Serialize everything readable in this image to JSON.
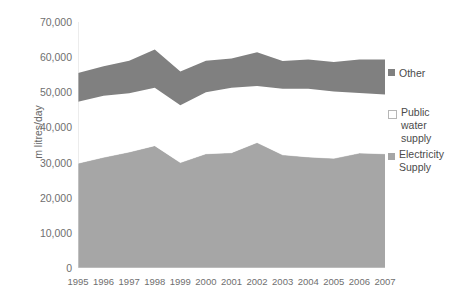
{
  "chart_data": {
    "type": "area",
    "stacked": true,
    "title": "",
    "subtitle": "",
    "xlabel": "",
    "ylabel": "m litres/day",
    "categories": [
      "1995",
      "1996",
      "1997",
      "1998",
      "1999",
      "2000",
      "2001",
      "2002",
      "2003",
      "2004",
      "2005",
      "2006",
      "2007"
    ],
    "ylim": [
      0,
      70000
    ],
    "ytick_labels": [
      "0",
      "10,000",
      "20,000",
      "30,000",
      "40,000",
      "50,000",
      "60,000",
      "70,000"
    ],
    "ytick_values": [
      0,
      10000,
      20000,
      30000,
      40000,
      50000,
      60000,
      70000
    ],
    "grid": false,
    "legend_position": "right",
    "series": [
      {
        "name": "Electricity Supply",
        "color": "#a6a6a6",
        "values": [
          29800,
          31500,
          33000,
          34800,
          30000,
          32500,
          32800,
          35700,
          32200,
          31600,
          31200,
          32700,
          32500
        ]
      },
      {
        "name": "Public water supply",
        "color": "#ffffff",
        "values": [
          17500,
          17500,
          16700,
          16500,
          16300,
          17500,
          18500,
          16100,
          18800,
          19400,
          19000,
          17100,
          16900
        ]
      },
      {
        "name": "Other",
        "color": "#808080",
        "values": [
          8200,
          8400,
          9300,
          10900,
          9600,
          9000,
          8300,
          9600,
          7900,
          8300,
          8400,
          9500,
          9900
        ]
      }
    ],
    "cumulative_tops": {
      "electricity_supply": [
        29800,
        31500,
        33000,
        34800,
        30000,
        32500,
        32800,
        35700,
        32200,
        31600,
        31200,
        32700,
        32500
      ],
      "plus_public_water_supply": [
        47300,
        49000,
        49700,
        51300,
        46300,
        50000,
        51300,
        51800,
        51000,
        51000,
        50200,
        49800,
        49400
      ],
      "plus_other_total": [
        55500,
        57400,
        59000,
        62200,
        55900,
        59000,
        59600,
        61400,
        58900,
        59300,
        58600,
        59300,
        59300
      ]
    }
  },
  "legend": {
    "items": [
      {
        "label": "Other",
        "swatch": "other-swatch"
      },
      {
        "label": "Public\nwater\nsupply",
        "swatch": "public-water-supply-swatch"
      },
      {
        "label": "Electricity\nSupply",
        "swatch": "electricity-supply-swatch"
      }
    ]
  },
  "axes": {
    "y_title": "m litres/day"
  }
}
